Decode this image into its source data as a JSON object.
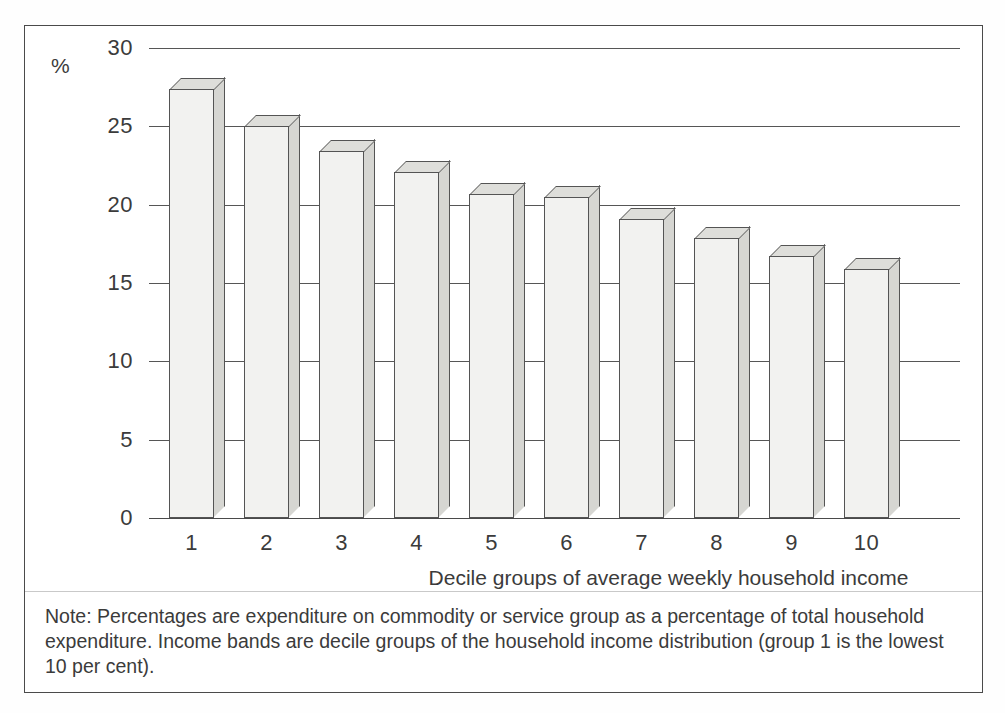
{
  "figure": {
    "axis_unit_symbol": "%",
    "note": "Note: Percentages are expenditure on commodity or service group as a percentage of total household expenditure. Income bands are decile groups of the household income distribution (group 1 is the lowest 10 per cent).",
    "border_color": "#4a4a4a",
    "bar_face_color": "#f2f2f0",
    "bar_side_color": "#d6d6d2",
    "bar_top_color": "#dededa",
    "gridline_color": "#565656",
    "text_color": "#3b3b3b"
  },
  "chart_data": {
    "type": "bar",
    "title": "",
    "subtitle": "",
    "xlabel": "Decile groups of average weekly household income",
    "ylabel": "%",
    "categories": [
      "1",
      "2",
      "3",
      "4",
      "5",
      "6",
      "7",
      "8",
      "9",
      "10"
    ],
    "values": [
      27.4,
      25.0,
      23.4,
      22.1,
      20.7,
      20.5,
      19.1,
      17.9,
      16.7,
      15.9
    ],
    "series": [
      {
        "name": "Expenditure as percentage of total household expenditure",
        "values": [
          27.4,
          25.0,
          23.4,
          22.1,
          20.7,
          20.5,
          19.1,
          17.9,
          16.7,
          15.9
        ]
      }
    ],
    "ylim": [
      0,
      30
    ],
    "yticks": [
      0,
      5,
      10,
      15,
      20,
      25,
      30
    ],
    "ytick_labels": [
      "0",
      "5",
      "10",
      "15",
      "20",
      "25",
      "30"
    ],
    "xtick_labels": [
      "1",
      "2",
      "3",
      "4",
      "5",
      "6",
      "7",
      "8",
      "9",
      "10"
    ],
    "grid": true,
    "grid_axis": "y",
    "legend": false,
    "legend_position": "none",
    "three_d": true,
    "annotations": []
  }
}
